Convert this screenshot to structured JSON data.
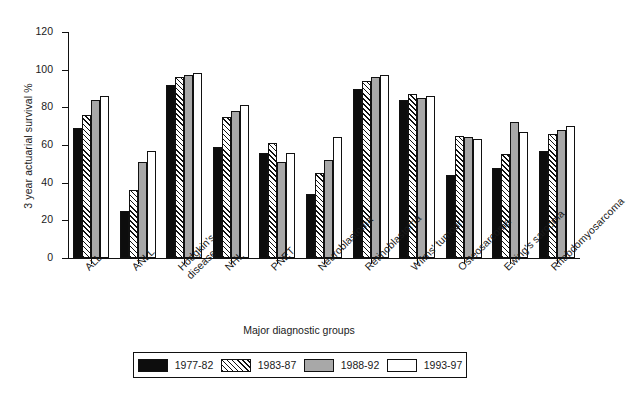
{
  "chart_data": {
    "type": "bar",
    "title": "",
    "xlabel": "Major diagnostic groups",
    "ylabel": "3 year actuarial survival %",
    "ylim": [
      0,
      120
    ],
    "yticks": [
      0,
      20,
      40,
      60,
      80,
      100,
      120
    ],
    "grid": false,
    "legend_position": "bottom",
    "categories": [
      "ALL",
      "ANLL",
      "Hodgkin's\ndisease",
      "NHL",
      "PNET",
      "Neuroblastoma",
      "Retinoblastoma",
      "Wilms' tumour",
      "Osteosarcoma",
      "Ewing's sarcoma",
      "Rhabdomyosarcoma"
    ],
    "series": [
      {
        "name": "1977-82",
        "fill": "solid-black",
        "color": "#0d0d0d",
        "values": [
          69,
          25,
          92,
          59,
          56,
          34,
          90,
          84,
          44,
          48,
          57
        ]
      },
      {
        "name": "1983-87",
        "fill": "diagonal-hatch",
        "color": "#ffffff",
        "values": [
          76,
          36,
          96,
          75,
          61,
          45,
          94,
          87,
          65,
          55,
          66
        ]
      },
      {
        "name": "1988-92",
        "fill": "solid-gray",
        "color": "#a8a8a8",
        "values": [
          84,
          51,
          97,
          78,
          51,
          52,
          96,
          85,
          64,
          72,
          68
        ]
      },
      {
        "name": "1993-97",
        "fill": "solid-white",
        "color": "#ffffff",
        "values": [
          86,
          57,
          98,
          81,
          56,
          64,
          97,
          86,
          63,
          67,
          70
        ]
      }
    ]
  },
  "legend": {
    "entries": [
      {
        "label": "1977-82"
      },
      {
        "label": "1983-87"
      },
      {
        "label": "1988-92"
      },
      {
        "label": "1993-97"
      }
    ]
  }
}
